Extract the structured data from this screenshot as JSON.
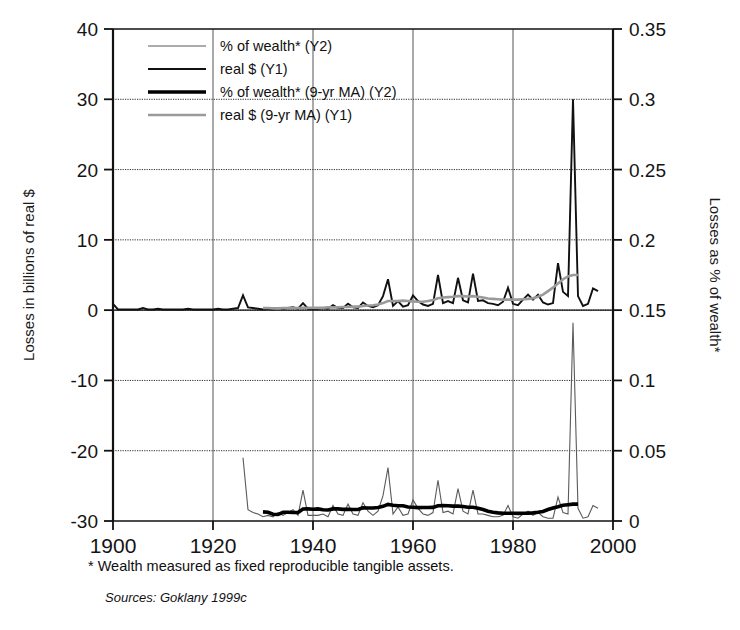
{
  "figure": {
    "background_color": "#ffffff",
    "plot_left_px": 113,
    "plot_right_px": 613,
    "plot_top_px": 29,
    "plot_bottom_px": 521
  },
  "footnotes": {
    "wealth_note": "* Wealth measured as fixed reproducible tangible assets.",
    "sources": "Sources: Goklany 1999c"
  },
  "legend": {
    "position": "top-left-inside",
    "entries": [
      {
        "label": "% of wealth* (Y2)",
        "color": "#5a5a5a",
        "width": 1.1,
        "style": "thin-gray"
      },
      {
        "label": "real $ (Y1)",
        "color": "#111111",
        "width": 1.9,
        "style": "medium-black"
      },
      {
        "label": "% of wealth* (9-yr MA) (Y2)",
        "color": "#000000",
        "width": 3.6,
        "style": "thick-black"
      },
      {
        "label": "real $ (9-yr MA) (Y1)",
        "color": "#9a9a9a",
        "width": 2.6,
        "style": "light-gray"
      }
    ]
  },
  "chart_data": {
    "type": "line",
    "title": "",
    "subtitle": "",
    "xlabel": "",
    "ylabel": "Losses in billions of real $",
    "y2label": "Losses as % of wealth*",
    "grid": true,
    "xlim": [
      1900,
      2000
    ],
    "ylim": [
      -30,
      40
    ],
    "y2lim": [
      0,
      0.35
    ],
    "xticks": [
      1900,
      1920,
      1940,
      1960,
      1980,
      2000
    ],
    "xticklabels": [
      "1900",
      "1920",
      "1940",
      "1960",
      "1980",
      "2000"
    ],
    "yticks": [
      -30,
      -20,
      -10,
      0,
      10,
      20,
      30,
      40
    ],
    "yticklabels": [
      "-30",
      "-20",
      "-10",
      "0",
      "10",
      "20",
      "30",
      "40"
    ],
    "y2ticks": [
      0,
      0.05,
      0.1,
      0.15,
      0.2,
      0.25,
      0.3,
      0.35
    ],
    "y2ticklabels": [
      "0",
      "0.05",
      "0.1",
      "0.15",
      "0.2",
      "0.25",
      "0.3",
      "0.35"
    ],
    "series": [
      {
        "name": "real $ (Y1)",
        "axis": "y1",
        "color": "#111111",
        "width": 1.9,
        "x": [
          1900,
          1901,
          1902,
          1903,
          1904,
          1905,
          1906,
          1907,
          1908,
          1909,
          1910,
          1911,
          1912,
          1913,
          1914,
          1915,
          1916,
          1917,
          1918,
          1919,
          1920,
          1921,
          1922,
          1923,
          1924,
          1925,
          1926,
          1927,
          1928,
          1929,
          1930,
          1931,
          1932,
          1933,
          1934,
          1935,
          1936,
          1937,
          1938,
          1939,
          1940,
          1941,
          1942,
          1943,
          1944,
          1945,
          1946,
          1947,
          1948,
          1949,
          1950,
          1951,
          1952,
          1953,
          1954,
          1955,
          1956,
          1957,
          1958,
          1959,
          1960,
          1961,
          1962,
          1963,
          1964,
          1965,
          1966,
          1967,
          1968,
          1969,
          1970,
          1971,
          1972,
          1973,
          1974,
          1975,
          1976,
          1977,
          1978,
          1979,
          1980,
          1981,
          1982,
          1983,
          1984,
          1985,
          1986,
          1987,
          1988,
          1989,
          1990,
          1991,
          1992,
          1993,
          1994,
          1995,
          1996,
          1997
        ],
        "values": [
          0.9,
          0.1,
          0.1,
          0.1,
          0.1,
          0.1,
          0.3,
          0.1,
          0.1,
          0.2,
          0.1,
          0.1,
          0.1,
          0.1,
          0.1,
          0.2,
          0.1,
          0.1,
          0.1,
          0.1,
          0.1,
          0.2,
          0.1,
          0.1,
          0.2,
          0.3,
          2.1,
          0.4,
          0.3,
          0.2,
          0.1,
          0.2,
          0.1,
          0.3,
          0.2,
          0.3,
          0.4,
          0.2,
          1.0,
          0.2,
          0.2,
          0.2,
          0.3,
          0.2,
          0.7,
          0.3,
          0.3,
          0.9,
          0.4,
          0.3,
          1.1,
          0.6,
          0.4,
          0.7,
          2.0,
          4.4,
          0.6,
          1.3,
          0.5,
          0.7,
          2.1,
          1.3,
          0.8,
          0.6,
          0.9,
          5.0,
          1.0,
          1.3,
          1.0,
          4.6,
          1.4,
          1.1,
          5.2,
          1.3,
          1.4,
          1.0,
          0.9,
          0.7,
          1.2,
          3.2,
          0.9,
          0.7,
          1.5,
          2.2,
          1.5,
          2.2,
          1.1,
          0.8,
          1.0,
          6.7,
          2.6,
          2.0,
          30.0,
          2.0,
          0.6,
          0.9,
          3.1,
          2.7
        ]
      },
      {
        "name": "real $ (9-yr MA) (Y1)",
        "axis": "y1",
        "color": "#9a9a9a",
        "width": 2.6,
        "x": [
          1930,
          1931,
          1932,
          1933,
          1934,
          1935,
          1936,
          1937,
          1938,
          1939,
          1940,
          1941,
          1942,
          1943,
          1944,
          1945,
          1946,
          1947,
          1948,
          1949,
          1950,
          1951,
          1952,
          1953,
          1954,
          1955,
          1956,
          1957,
          1958,
          1959,
          1960,
          1961,
          1962,
          1963,
          1964,
          1965,
          1966,
          1967,
          1968,
          1969,
          1970,
          1971,
          1972,
          1973,
          1974,
          1975,
          1976,
          1977,
          1978,
          1979,
          1980,
          1981,
          1982,
          1983,
          1984,
          1985,
          1986,
          1987,
          1988,
          1989,
          1990,
          1991,
          1992,
          1993
        ],
        "values": [
          0.3,
          0.3,
          0.25,
          0.25,
          0.3,
          0.3,
          0.3,
          0.3,
          0.35,
          0.35,
          0.35,
          0.35,
          0.35,
          0.4,
          0.4,
          0.4,
          0.45,
          0.45,
          0.5,
          0.5,
          0.6,
          0.65,
          0.7,
          0.8,
          1.0,
          1.3,
          1.3,
          1.3,
          1.35,
          1.3,
          1.25,
          1.2,
          1.2,
          1.3,
          1.45,
          1.7,
          1.8,
          1.85,
          1.9,
          2.0,
          2.0,
          1.95,
          2.0,
          1.9,
          1.8,
          1.65,
          1.6,
          1.55,
          1.5,
          1.5,
          1.5,
          1.5,
          1.55,
          1.6,
          1.7,
          1.9,
          2.2,
          2.7,
          3.2,
          3.8,
          4.4,
          4.8,
          5.0,
          5.0
        ]
      },
      {
        "name": "% of wealth* (Y2)",
        "axis": "y2",
        "color": "#5a5a5a",
        "width": 1.1,
        "x": [
          1926,
          1927,
          1928,
          1929,
          1930,
          1931,
          1932,
          1933,
          1934,
          1935,
          1936,
          1937,
          1938,
          1939,
          1940,
          1941,
          1942,
          1943,
          1944,
          1945,
          1946,
          1947,
          1948,
          1949,
          1950,
          1951,
          1952,
          1953,
          1954,
          1955,
          1956,
          1957,
          1958,
          1959,
          1960,
          1961,
          1962,
          1963,
          1964,
          1965,
          1966,
          1967,
          1968,
          1969,
          1970,
          1971,
          1972,
          1973,
          1974,
          1975,
          1976,
          1977,
          1978,
          1979,
          1980,
          1981,
          1982,
          1983,
          1984,
          1985,
          1986,
          1987,
          1988,
          1989,
          1990,
          1991,
          1992,
          1993,
          1994,
          1995,
          1996,
          1997
        ],
        "values": [
          0.045,
          0.008,
          0.006,
          0.005,
          0.003,
          0.004,
          0.003,
          0.006,
          0.004,
          0.006,
          0.008,
          0.004,
          0.022,
          0.004,
          0.004,
          0.004,
          0.005,
          0.003,
          0.011,
          0.005,
          0.004,
          0.012,
          0.005,
          0.004,
          0.013,
          0.007,
          0.004,
          0.007,
          0.018,
          0.038,
          0.005,
          0.01,
          0.004,
          0.005,
          0.015,
          0.009,
          0.005,
          0.004,
          0.006,
          0.029,
          0.006,
          0.007,
          0.005,
          0.023,
          0.007,
          0.005,
          0.022,
          0.005,
          0.005,
          0.004,
          0.003,
          0.003,
          0.004,
          0.011,
          0.003,
          0.002,
          0.005,
          0.007,
          0.004,
          0.006,
          0.003,
          0.002,
          0.002,
          0.017,
          0.006,
          0.005,
          0.141,
          0.009,
          0.002,
          0.003,
          0.011,
          0.009
        ]
      },
      {
        "name": "% of wealth* (9-yr MA) (Y2)",
        "axis": "y2",
        "color": "#000000",
        "width": 3.6,
        "x": [
          1930,
          1931,
          1932,
          1933,
          1934,
          1935,
          1936,
          1937,
          1938,
          1939,
          1940,
          1941,
          1942,
          1943,
          1944,
          1945,
          1946,
          1947,
          1948,
          1949,
          1950,
          1951,
          1952,
          1953,
          1954,
          1955,
          1956,
          1957,
          1958,
          1959,
          1960,
          1961,
          1962,
          1963,
          1964,
          1965,
          1966,
          1967,
          1968,
          1969,
          1970,
          1971,
          1972,
          1973,
          1974,
          1975,
          1976,
          1977,
          1978,
          1979,
          1980,
          1981,
          1982,
          1983,
          1984,
          1985,
          1986,
          1987,
          1988,
          1989,
          1990,
          1991,
          1992,
          1993
        ],
        "values": [
          0.0065,
          0.0062,
          0.0048,
          0.0046,
          0.0062,
          0.0062,
          0.006,
          0.006,
          0.0085,
          0.0086,
          0.0084,
          0.0086,
          0.008,
          0.0078,
          0.0086,
          0.0086,
          0.0083,
          0.0084,
          0.0082,
          0.0082,
          0.0094,
          0.0093,
          0.0092,
          0.0096,
          0.0104,
          0.0118,
          0.0112,
          0.0108,
          0.0108,
          0.01,
          0.0098,
          0.0095,
          0.0096,
          0.0096,
          0.0097,
          0.0108,
          0.011,
          0.0108,
          0.0106,
          0.0106,
          0.0103,
          0.0098,
          0.0098,
          0.009,
          0.0082,
          0.007,
          0.0062,
          0.0058,
          0.0055,
          0.0055,
          0.0055,
          0.0054,
          0.0055,
          0.0056,
          0.0058,
          0.0062,
          0.0068,
          0.0082,
          0.0093,
          0.0102,
          0.0112,
          0.0116,
          0.012,
          0.012
        ]
      }
    ]
  }
}
